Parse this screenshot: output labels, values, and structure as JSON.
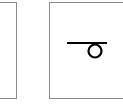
{
  "panels": [
    {
      "id": "left",
      "content": "",
      "partially_visible": true
    },
    {
      "id": "right",
      "content": "symbol",
      "partially_visible": true
    }
  ],
  "symbol": {
    "name": "line-with-loop-symbol",
    "stroke_color": "#000000",
    "border_color": "#8a8a8a"
  }
}
